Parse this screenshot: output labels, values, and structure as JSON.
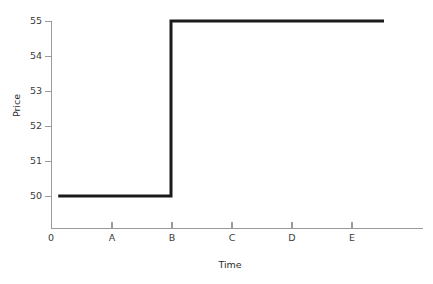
{
  "chart_data": {
    "type": "line",
    "title": "",
    "xlabel": "Time",
    "ylabel": "Price",
    "grid": false,
    "legend": null,
    "step": "post",
    "categories": [
      "0",
      "A",
      "B",
      "C",
      "D",
      "E"
    ],
    "x_tick_labels": [
      "0",
      "A",
      "B",
      "C",
      "D",
      "E"
    ],
    "y_tick_labels": [
      "50",
      "51",
      "52",
      "53",
      "54",
      "55"
    ],
    "y_ticks": [
      50,
      51,
      52,
      53,
      54,
      55
    ],
    "ylim": [
      49.0,
      55.4
    ],
    "xlim": [
      0,
      6.2
    ],
    "series": [
      {
        "name": "Price",
        "color": "#1a1a1a",
        "line_width": 3,
        "x": [
          0.12,
          2.0,
          2.0,
          5.55
        ],
        "values": [
          50,
          50,
          55,
          55
        ],
        "points": [
          {
            "x": "just after 0",
            "y": 50
          },
          {
            "x": "B",
            "y": 50
          },
          {
            "x": "B",
            "y": 55
          },
          {
            "x": "past E",
            "y": 55
          }
        ]
      }
    ],
    "annotations": [
      {
        "text": "Price jumps from 50 to 55 at time B",
        "type": "description"
      }
    ]
  },
  "axes": {
    "y_title": "Price",
    "x_title": "Time",
    "y_tick_labels": [
      "55",
      "54",
      "53",
      "52",
      "51",
      "50"
    ],
    "x_tick_labels": [
      "0",
      "A",
      "B",
      "C",
      "D",
      "E"
    ]
  },
  "colors": {
    "series": "#1a1a1a",
    "axis": "#9a9a9a",
    "tick_text": "#3c3c3c",
    "title_text": "#2b2b2b",
    "background": "#ffffff"
  }
}
